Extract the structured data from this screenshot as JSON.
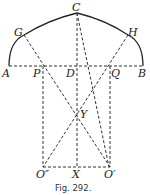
{
  "figure": {
    "caption": "Fig. 292.",
    "labels": {
      "A": "A",
      "B": "B",
      "C": "C",
      "D": "D",
      "G": "G",
      "H": "H",
      "P": "P",
      "Q": "Q",
      "Y": "Y",
      "X": "X",
      "O1": "O′",
      "O2": "O″"
    },
    "points": {
      "A": [
        9,
        66
      ],
      "B": [
        143,
        66
      ],
      "C": [
        77,
        13
      ],
      "G": [
        24,
        35
      ],
      "H": [
        128,
        35
      ],
      "P": [
        43,
        66
      ],
      "D": [
        77,
        66
      ],
      "Q": [
        110,
        66
      ],
      "Y": [
        77,
        114
      ],
      "O2": [
        43,
        167
      ],
      "X": [
        77,
        167
      ],
      "O1": [
        110,
        167
      ]
    }
  }
}
